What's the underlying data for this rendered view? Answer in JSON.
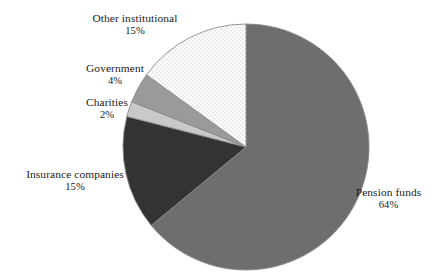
{
  "chart_data": {
    "type": "pie",
    "title": "",
    "subtitle": "",
    "xlabel": "",
    "ylabel": "",
    "legend_position": "none",
    "grid": false,
    "labels_show_percent": true,
    "start_angle_deg": 0,
    "direction": "clockwise",
    "categories": [
      "Pension funds",
      "Insurance companies",
      "Charities",
      "Government",
      "Other institutional"
    ],
    "values": [
      64,
      15,
      2,
      4,
      15
    ],
    "units": "%",
    "total": 100,
    "slices": [
      {
        "name": "Pension funds",
        "value": 64,
        "value_label": "64%",
        "color": "#6e6e6e",
        "pattern": "solid",
        "start_deg": 0,
        "end_deg": 230.4
      },
      {
        "name": "Insurance companies",
        "value": 15,
        "value_label": "15%",
        "color": "#333333",
        "pattern": "solid",
        "start_deg": 230.4,
        "end_deg": 284.4
      },
      {
        "name": "Charities",
        "value": 2,
        "value_label": "2%",
        "color": "#c9c9c9",
        "pattern": "solid",
        "start_deg": 284.4,
        "end_deg": 291.6
      },
      {
        "name": "Government",
        "value": 4,
        "value_label": "4%",
        "color": "#9a9a9a",
        "pattern": "solid",
        "start_deg": 291.6,
        "end_deg": 306.0
      },
      {
        "name": "Other institutional",
        "value": 15,
        "value_label": "15%",
        "color": "#ffffff",
        "pattern": "checker",
        "start_deg": 306.0,
        "end_deg": 360.0
      }
    ],
    "stroke_color": "#8a8a8a",
    "background_color": "#ffffff"
  },
  "labels": {
    "other_institutional": {
      "name": "Other institutional",
      "pct": "15%"
    },
    "government": {
      "name": "Government",
      "pct": "4%"
    },
    "charities": {
      "name": "Charities",
      "pct": "2%"
    },
    "insurance_companies": {
      "name": "Insurance companies",
      "pct": "15%"
    },
    "pension_funds": {
      "name": "Pension funds",
      "pct": "64%"
    }
  }
}
